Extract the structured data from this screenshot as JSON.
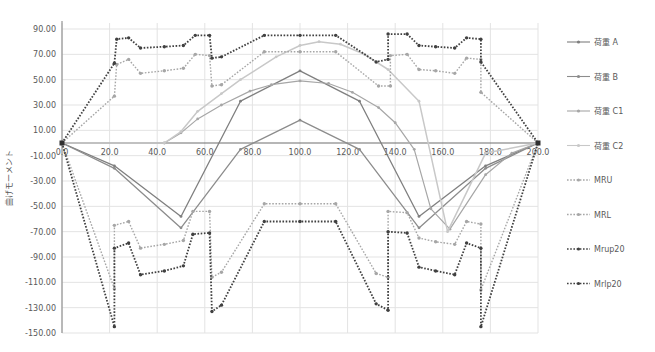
{
  "chart_data": {
    "type": "line",
    "title": "",
    "xlabel": "",
    "ylabel": "曲げモーメント",
    "xlim": [
      0,
      200
    ],
    "ylim": [
      -150,
      90
    ],
    "x_ticks": [
      "0.0",
      "20.0",
      "40.0",
      "60.0",
      "80.0",
      "100.0",
      "120.0",
      "140.0",
      "160.0",
      "180.0",
      "200.0"
    ],
    "y_ticks": [
      "90.00",
      "70.00",
      "50.00",
      "30.00",
      "10.00",
      "-10.00",
      "-30.00",
      "-50.00",
      "-70.00",
      "-90.00",
      "-110.00",
      "-130.00",
      "-150.00"
    ],
    "grid": true,
    "legend_position": "right",
    "series": [
      {
        "name": "荷重 A",
        "color": "#7f7f7f",
        "dash": "solid",
        "width": 1.3,
        "marker": "dot",
        "points": [
          [
            0,
            0
          ],
          [
            22,
            -18
          ],
          [
            50,
            -58
          ],
          [
            75,
            33
          ],
          [
            100,
            57
          ],
          [
            125,
            33
          ],
          [
            150,
            -58
          ],
          [
            178,
            -18
          ],
          [
            200,
            0
          ]
        ]
      },
      {
        "name": "荷重 B",
        "color": "#8c8c8c",
        "dash": "solid",
        "width": 1.3,
        "marker": "dot",
        "points": [
          [
            0,
            0
          ],
          [
            22,
            -20
          ],
          [
            50,
            -67
          ],
          [
            75,
            -5
          ],
          [
            100,
            18
          ],
          [
            125,
            -5
          ],
          [
            150,
            -67
          ],
          [
            178,
            -20
          ],
          [
            200,
            0
          ]
        ]
      },
      {
        "name": "荷重 C1",
        "color": "#a6a6a6",
        "dash": "solid",
        "width": 1.2,
        "marker": "dot",
        "points": [
          [
            0,
            0
          ],
          [
            43,
            0
          ],
          [
            50,
            8
          ],
          [
            57,
            19
          ],
          [
            67,
            30
          ],
          [
            79,
            41
          ],
          [
            88,
            46
          ],
          [
            100,
            49
          ],
          [
            112,
            47
          ],
          [
            122,
            40
          ],
          [
            133,
            28
          ],
          [
            140,
            16
          ],
          [
            148,
            -5
          ],
          [
            155,
            -52
          ],
          [
            163,
            -68
          ],
          [
            178,
            -25
          ],
          [
            189,
            -8
          ],
          [
            200,
            0
          ]
        ]
      },
      {
        "name": "荷重 C2",
        "color": "#c8c8c8",
        "dash": "solid",
        "width": 1.5,
        "marker": "dot",
        "points": [
          [
            0,
            0
          ],
          [
            43,
            0
          ],
          [
            50,
            9
          ],
          [
            57,
            25
          ],
          [
            67,
            39
          ],
          [
            75,
            50
          ],
          [
            90,
            68
          ],
          [
            100,
            77
          ],
          [
            108,
            80
          ],
          [
            117,
            78
          ],
          [
            127,
            70
          ],
          [
            137,
            58
          ],
          [
            150,
            33
          ],
          [
            162,
            -70
          ],
          [
            178,
            -8
          ],
          [
            200,
            0
          ]
        ]
      },
      {
        "name": "MRU",
        "color": "#a6a6a6",
        "dash": "dotted",
        "width": 1.4,
        "marker": "dot",
        "points": [
          [
            0,
            0
          ],
          [
            22,
            37
          ],
          [
            23,
            62
          ],
          [
            28,
            66
          ],
          [
            33,
            55
          ],
          [
            43,
            57
          ],
          [
            51,
            59
          ],
          [
            56,
            70
          ],
          [
            62,
            69
          ],
          [
            63,
            45
          ],
          [
            67,
            46
          ],
          [
            85,
            72
          ],
          [
            100,
            72
          ],
          [
            115,
            72
          ],
          [
            133,
            45
          ],
          [
            138,
            45
          ],
          [
            138,
            69
          ],
          [
            145,
            70
          ],
          [
            150,
            58
          ],
          [
            157,
            57
          ],
          [
            165,
            55
          ],
          [
            170,
            67
          ],
          [
            176,
            66
          ],
          [
            176,
            40
          ],
          [
            200,
            0
          ]
        ]
      },
      {
        "name": "MRL",
        "color": "#a6a6a6",
        "dash": "dotted",
        "width": 1.4,
        "marker": "dot",
        "points": [
          [
            0,
            0
          ],
          [
            22,
            -115
          ],
          [
            22,
            -65
          ],
          [
            28,
            -62
          ],
          [
            33,
            -83
          ],
          [
            43,
            -80
          ],
          [
            51,
            -77
          ],
          [
            55,
            -54
          ],
          [
            62,
            -54
          ],
          [
            63,
            -106
          ],
          [
            67,
            -102
          ],
          [
            85,
            -48
          ],
          [
            100,
            -48
          ],
          [
            115,
            -48
          ],
          [
            132,
            -103
          ],
          [
            137,
            -106
          ],
          [
            137,
            -54
          ],
          [
            145,
            -55
          ],
          [
            150,
            -75
          ],
          [
            157,
            -78
          ],
          [
            165,
            -80
          ],
          [
            170,
            -62
          ],
          [
            176,
            -64
          ],
          [
            176,
            -116
          ],
          [
            200,
            0
          ]
        ]
      },
      {
        "name": "Mrup20",
        "color": "#404040",
        "dash": "dotted",
        "width": 1.8,
        "marker": "dot",
        "points": [
          [
            0,
            0
          ],
          [
            22,
            63
          ],
          [
            23,
            82
          ],
          [
            28,
            83
          ],
          [
            33,
            75
          ],
          [
            43,
            76
          ],
          [
            51,
            77
          ],
          [
            56,
            85
          ],
          [
            62,
            85
          ],
          [
            63,
            67
          ],
          [
            67,
            68
          ],
          [
            85,
            85
          ],
          [
            100,
            85
          ],
          [
            115,
            85
          ],
          [
            132,
            64
          ],
          [
            137,
            66
          ],
          [
            137,
            86
          ],
          [
            145,
            86
          ],
          [
            150,
            77
          ],
          [
            157,
            76
          ],
          [
            165,
            75
          ],
          [
            170,
            83
          ],
          [
            176,
            82
          ],
          [
            176,
            64
          ],
          [
            200,
            0
          ]
        ]
      },
      {
        "name": "Mrlp20",
        "color": "#404040",
        "dash": "dotted",
        "width": 1.8,
        "marker": "dot",
        "points": [
          [
            0,
            0
          ],
          [
            22,
            -145
          ],
          [
            22,
            -83
          ],
          [
            28,
            -79
          ],
          [
            33,
            -104
          ],
          [
            43,
            -101
          ],
          [
            51,
            -97
          ],
          [
            55,
            -72
          ],
          [
            62,
            -71
          ],
          [
            63,
            -133
          ],
          [
            67,
            -128
          ],
          [
            85,
            -62
          ],
          [
            100,
            -62
          ],
          [
            115,
            -62
          ],
          [
            132,
            -127
          ],
          [
            137,
            -132
          ],
          [
            137,
            -70
          ],
          [
            145,
            -71
          ],
          [
            150,
            -98
          ],
          [
            157,
            -101
          ],
          [
            165,
            -104
          ],
          [
            170,
            -79
          ],
          [
            176,
            -83
          ],
          [
            176,
            -145
          ],
          [
            200,
            0
          ]
        ]
      }
    ]
  },
  "chart_caption": ""
}
